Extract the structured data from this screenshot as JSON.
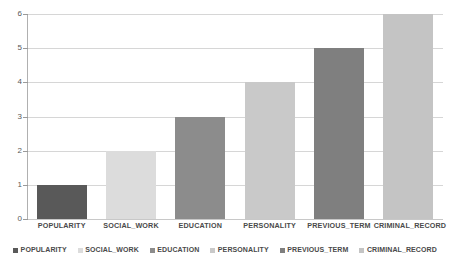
{
  "chart_data": {
    "type": "bar",
    "title": "",
    "subtitle": "",
    "xlabel": "",
    "ylabel": "",
    "categories": [
      "POPULARITY",
      "SOCIAL_WORK",
      "EDUCATION",
      "PERSONALITY",
      "PREVIOUS_TERM",
      "CRIMINAL_RECORD"
    ],
    "values": [
      1,
      2,
      3,
      4,
      5,
      6
    ],
    "series": [
      {
        "name": "Feature importance rank",
        "values": [
          1,
          2,
          3,
          4,
          5,
          6
        ]
      }
    ],
    "bar_colors": [
      "#595959",
      "#dcdcdc",
      "#8c8c8c",
      "#c9c9c9",
      "#7f7f7f",
      "#c4c4c4"
    ],
    "ylim": [
      0,
      6
    ],
    "yticks": [
      0,
      1,
      2,
      3,
      4,
      5,
      6
    ],
    "ytick_labels": [
      "0",
      "1",
      "2",
      "3",
      "4",
      "5",
      "6"
    ],
    "grid": true,
    "grid_axis": "y",
    "legend_position": "bottom",
    "legend": [
      {
        "label": "POPULARITY",
        "color": "#595959"
      },
      {
        "label": "SOCIAL_WORK",
        "color": "#dcdcdc"
      },
      {
        "label": "EDUCATION",
        "color": "#8c8c8c"
      },
      {
        "label": "PERSONALITY",
        "color": "#c9c9c9"
      },
      {
        "label": "PREVIOUS_TERM",
        "color": "#7f7f7f"
      },
      {
        "label": "CRIMINAL_RECORD",
        "color": "#c4c4c4"
      }
    ],
    "colors": {
      "background": "#ffffff",
      "gridline": "#d6d6d6",
      "axis": "#b0b0b0",
      "tick_text": "#595959",
      "label_text": "#4a4a4a"
    }
  }
}
